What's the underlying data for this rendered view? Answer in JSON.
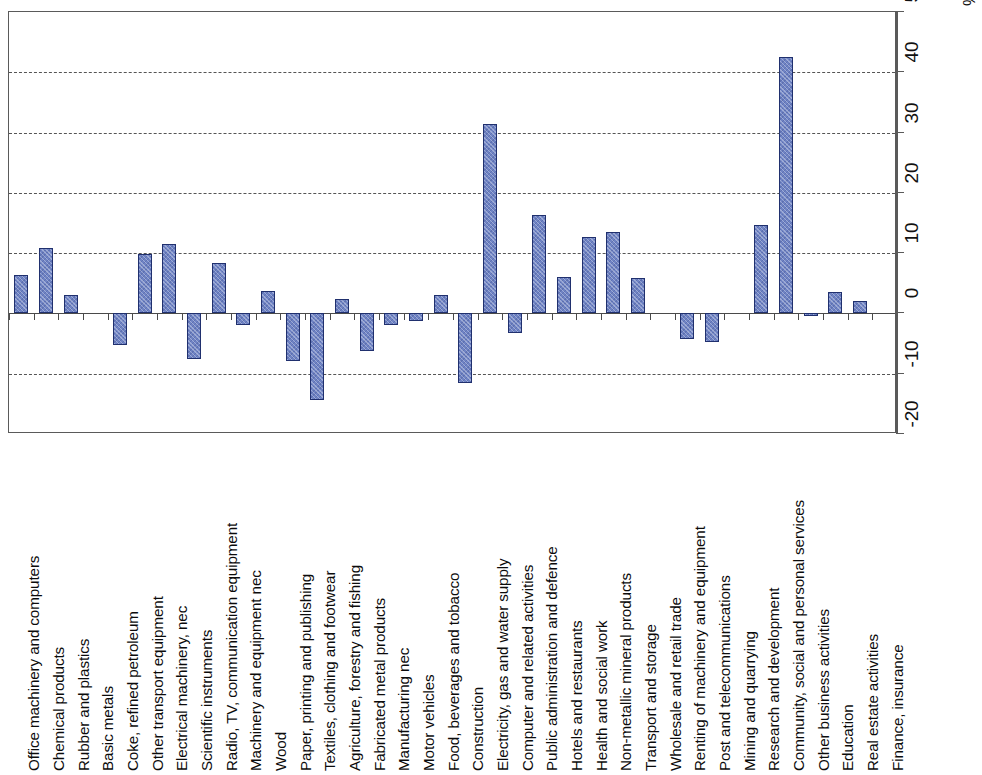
{
  "chart_data": {
    "type": "bar",
    "title": "",
    "subtitle": "",
    "xlabel": "",
    "ylabel": "%",
    "unit": "%",
    "ylim": [
      -20,
      50
    ],
    "ytick_labels": [
      "50",
      "40",
      "30",
      "20",
      "10",
      "0",
      "-10",
      "-20"
    ],
    "yticks": [
      50,
      40,
      30,
      20,
      10,
      0,
      -10,
      -20
    ],
    "gridlines": [
      40,
      30,
      20,
      10,
      -10
    ],
    "grid": true,
    "grid_style": "dashed",
    "legend": null,
    "legend_position": "none",
    "bar_color": "#6f83c4",
    "bar_border_color": "#20306e",
    "axis_color": "#5a5a5a",
    "orientation": "vertical",
    "categories": [
      "Office machinery and computers",
      "Chemical products",
      "Rubber and plastics",
      "Basic metals",
      "Coke, refined petroleum",
      "Other transport equipment",
      "Electrical machinery, nec",
      "Scientific instruments",
      "Radio, TV, communication equipment",
      "Machinery and equipment nec",
      "Wood",
      "Paper, printing and publishing",
      "Textiles, clothing and footwear",
      "Agriculture, forestry and fishing",
      "Fabricated metal products",
      "Manufacturing nec",
      "Motor vehicles",
      "Food, beverages and tobacco",
      "Construction",
      "Electricity, gas and water supply",
      "Computer and related activities",
      "Public administration and defence",
      "Hotels and restaurants",
      "Health and social work",
      "Non-metallic mineral products",
      "Transport and storage",
      "Wholesale and retail trade",
      "Renting of machinery and equipment",
      "Post and telecommunications",
      "Mining and quarrying",
      "Research and development",
      "Community, social and personal services",
      "Other business activities",
      "Education",
      "Real estate activities",
      "Finance, insurance"
    ],
    "values": [
      6.3,
      10.8,
      3.0,
      0,
      -5.2,
      9.9,
      11.5,
      -7.5,
      8.3,
      -2.0,
      3.8,
      -7.9,
      -14.3,
      2.4,
      -6.3,
      -1.9,
      -1.3,
      3.1,
      -11.5,
      31.5,
      -3.2,
      16.3,
      6.0,
      12.7,
      13.5,
      5.8,
      0,
      -4.2,
      -4.8,
      0,
      14.7,
      42.5,
      -0.4,
      3.5,
      2.0,
      0
    ],
    "bar_values_by_category": [
      {
        "category": "Office machinery and computers",
        "value": 6.3
      },
      {
        "category": "Chemical products",
        "value": 10.8
      },
      {
        "category": "Rubber and plastics",
        "value": 3.0
      },
      {
        "category": "Basic metals",
        "value": null
      },
      {
        "category": "Coke, refined petroleum",
        "value": -5.2
      },
      {
        "category": "Other transport equipment",
        "value": 9.9
      },
      {
        "category": "Electrical machinery, nec",
        "value": 11.5
      },
      {
        "category": "Scientific instruments",
        "value": -7.5
      },
      {
        "category": "Radio, TV, communication equipment",
        "value": 8.3
      },
      {
        "category": "Machinery and equipment nec",
        "value": -2.0
      },
      {
        "category": "Wood",
        "value": 3.8
      },
      {
        "category": "Paper, printing and publishing",
        "value": -7.9
      },
      {
        "category": "Textiles, clothing and footwear",
        "value": -14.3
      },
      {
        "category": "Agriculture, forestry and fishing",
        "value": 2.4
      },
      {
        "category": "Fabricated metal products",
        "value": -6.3
      },
      {
        "category": "Manufacturing nec",
        "value": -1.9
      },
      {
        "category": "Motor vehicles",
        "value": -1.3
      },
      {
        "category": "Food, beverages and tobacco",
        "value": 3.1
      },
      {
        "category": "Construction",
        "value": -11.5
      },
      {
        "category": "Electricity, gas and water supply",
        "value": 31.5
      },
      {
        "category": "Computer and related activities",
        "value": -3.2
      },
      {
        "category": "Public administration and defence",
        "value": 16.3
      },
      {
        "category": "Hotels and restaurants",
        "value": 6.0
      },
      {
        "category": "Health and social work",
        "value": 12.7
      },
      {
        "category": "Non-metallic mineral products",
        "value": 13.5
      },
      {
        "category": "Transport and storage",
        "value": 5.8
      },
      {
        "category": "Wholesale and retail trade",
        "value": null
      },
      {
        "category": "Renting of machinery and equipment",
        "value": -4.2
      },
      {
        "category": "Post and telecommunications",
        "value": -4.8
      },
      {
        "category": "Mining and quarrying",
        "value": null
      },
      {
        "category": "Research and development",
        "value": 14.7
      },
      {
        "category": "Community, social and personal services",
        "value": 42.5
      },
      {
        "category": "Other business activities",
        "value": -0.4
      },
      {
        "category": "Education",
        "value": 3.5
      },
      {
        "category": "Real estate activities",
        "value": 2.0
      },
      {
        "category": "Finance, insurance",
        "value": null
      }
    ]
  }
}
